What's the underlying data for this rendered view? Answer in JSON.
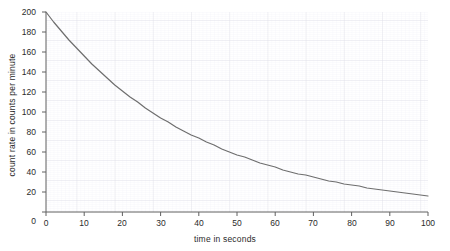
{
  "chart_data": {
    "type": "line",
    "title": "",
    "xlabel": "time in seconds",
    "ylabel": "count rate in counts per minute",
    "xlim": [
      0,
      100
    ],
    "ylim": [
      0,
      200
    ],
    "xticks": [
      0,
      10,
      20,
      30,
      40,
      50,
      60,
      70,
      80,
      90,
      100
    ],
    "yticks": [
      0,
      20,
      40,
      60,
      80,
      100,
      120,
      140,
      160,
      180,
      200
    ],
    "ytick_labels": [
      "0",
      "20",
      "40",
      "60",
      "80",
      "100",
      "120",
      "140",
      "160",
      "180",
      "200"
    ],
    "xtick_labels": [
      "0",
      "10",
      "20",
      "30",
      "40",
      "50",
      "60",
      "70",
      "80",
      "90",
      "100"
    ],
    "grid": true,
    "legend": "none",
    "series": [
      {
        "name": "count rate",
        "color": "#6e6e6e",
        "x": [
          0,
          2,
          4,
          6,
          8,
          10,
          12,
          14,
          16,
          18,
          20,
          22,
          24,
          26,
          28,
          30,
          32,
          34,
          36,
          38,
          40,
          42,
          44,
          46,
          48,
          50,
          52,
          54,
          56,
          58,
          60,
          62,
          64,
          66,
          68,
          70,
          72,
          74,
          76,
          78,
          80,
          82,
          84,
          86,
          88,
          90,
          92,
          94,
          96,
          98,
          100
        ],
        "values": [
          200,
          190,
          181,
          172,
          164,
          156,
          148,
          141,
          134,
          127,
          121,
          115,
          110,
          104,
          99,
          94,
          90,
          85,
          81,
          77,
          74,
          70,
          67,
          63,
          60,
          57,
          55,
          52,
          49,
          47,
          45,
          42,
          40,
          38,
          37,
          35,
          33,
          31,
          30,
          28,
          27,
          26,
          24,
          23,
          22,
          21,
          20,
          19,
          18,
          17,
          16
        ]
      }
    ],
    "model": "N = 200 * exp(-t/40)",
    "initial_value": 200,
    "value_at_100": 16
  },
  "axes": {
    "x_title": "time in seconds",
    "y_title": "count rate in counts per minute"
  },
  "colors": {
    "curve": "#6e6e6e",
    "axis": "#555555",
    "grid_major": "#d8d8e0",
    "grid_minor": "#ececf2",
    "text": "#2b2b2b",
    "background": "#ffffff"
  }
}
